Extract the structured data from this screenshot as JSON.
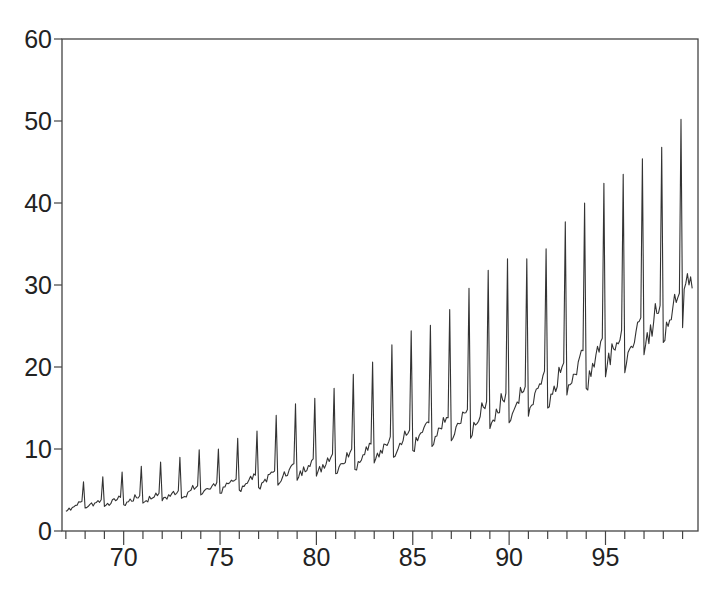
{
  "chart_data": {
    "type": "line",
    "title": "",
    "xlabel": "",
    "ylabel": "",
    "frequency": "monthly",
    "x_start": 1967.0,
    "x_end": 1999.5,
    "xlim": [
      66.8,
      99.8
    ],
    "ylim": [
      0,
      60
    ],
    "grid": false,
    "legend": null,
    "x_ticks": [
      70,
      75,
      80,
      85,
      90,
      95
    ],
    "x_tick_labels": [
      "70",
      "75",
      "80",
      "85",
      "90",
      "95"
    ],
    "x_minor_ticks_per_year": true,
    "y_ticks": [
      0,
      10,
      20,
      30,
      40,
      50,
      60
    ],
    "y_tick_labels": [
      "0",
      "10",
      "20",
      "30",
      "40",
      "50",
      "60"
    ],
    "line_color": "#333333",
    "series": [
      {
        "name": "monthly series",
        "years": [
          1967,
          1968,
          1969,
          1970,
          1971,
          1972,
          1973,
          1974,
          1975,
          1976,
          1977,
          1978,
          1979,
          1980,
          1981,
          1982,
          1983,
          1984,
          1985,
          1986,
          1987,
          1988,
          1989,
          1990,
          1991,
          1992,
          1993,
          1994,
          1995,
          1996,
          1997,
          1998,
          1999
        ],
        "jan_level": [
          2.4,
          2.8,
          3.0,
          3.2,
          3.4,
          3.7,
          4.0,
          4.4,
          4.6,
          5.0,
          5.3,
          5.6,
          6.2,
          6.7,
          7.0,
          7.5,
          8.3,
          9.0,
          9.8,
          10.3,
          11.0,
          11.3,
          12.5,
          13.2,
          14.0,
          15.0,
          16.6,
          17.4,
          18.8,
          19.3,
          21.5,
          23.0,
          24.8
        ],
        "nov_level": [
          3.6,
          3.8,
          4.1,
          4.3,
          4.6,
          4.9,
          5.5,
          5.9,
          6.3,
          6.8,
          7.3,
          8.2,
          8.8,
          9.4,
          10.0,
          10.6,
          11.5,
          12.3,
          13.2,
          13.8,
          14.8,
          15.8,
          16.8,
          17.6,
          19.5,
          20.5,
          22.0,
          23.5,
          24.5,
          26.0,
          27.5,
          29.0,
          null
        ],
        "dec_peak": [
          6.0,
          6.6,
          7.2,
          7.9,
          8.4,
          9.0,
          9.9,
          10.0,
          11.3,
          12.2,
          14.1,
          15.5,
          16.2,
          17.4,
          19.1,
          20.6,
          22.7,
          24.4,
          25.1,
          27.0,
          29.6,
          31.8,
          33.2,
          33.2,
          34.4,
          37.7,
          40.0,
          42.4,
          43.5,
          45.4,
          46.8,
          50.2,
          null
        ],
        "last_values_1999": [
          24.8,
          29.5,
          30.2,
          31.4,
          30.0,
          31.0,
          29.6
        ]
      }
    ]
  },
  "axes": {
    "y_labels": [
      "0",
      "10",
      "20",
      "30",
      "40",
      "50",
      "60"
    ],
    "x_labels": [
      "70",
      "75",
      "80",
      "85",
      "90",
      "95"
    ]
  }
}
